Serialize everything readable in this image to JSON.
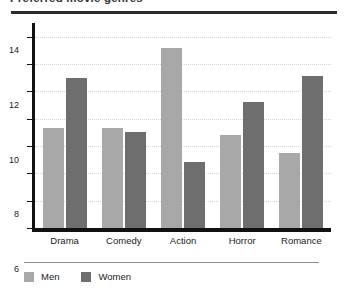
{
  "title": "Preferred movie genres",
  "chart_data": {
    "type": "bar",
    "title": "Preferred movie genres",
    "xlabel": "",
    "ylabel": "",
    "ylim": [
      0,
      15
    ],
    "yticks": [
      0,
      2,
      4,
      6,
      8,
      10,
      12,
      14
    ],
    "grid": true,
    "legend_position": "bottom-left",
    "categories": [
      "Drama",
      "Comedy",
      "Action",
      "Horror",
      "Romance"
    ],
    "series": [
      {
        "name": "Men",
        "color": "#a8a8a8",
        "values": [
          7.3,
          7.3,
          13.2,
          6.8,
          5.5
        ]
      },
      {
        "name": "Women",
        "color": "#6e6e6e",
        "values": [
          11.0,
          7.0,
          4.8,
          9.2,
          11.1
        ]
      }
    ]
  },
  "legend": [
    {
      "label": "Men"
    },
    {
      "label": "Women"
    }
  ]
}
